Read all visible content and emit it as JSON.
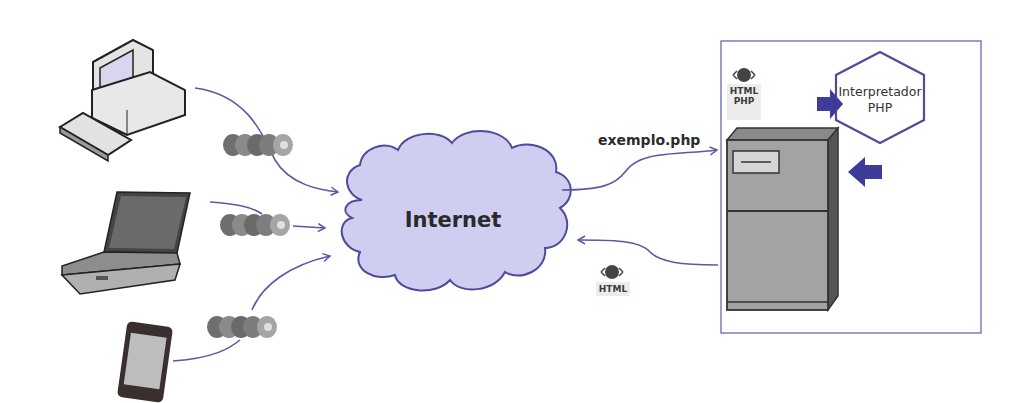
{
  "diagram": {
    "type": "client-server flow",
    "colors": {
      "line": "#5b58a6",
      "cloud_fill": "#cfcdf0",
      "cloud_stroke": "#4e4b9a",
      "arrow_fill": "#3f3b99",
      "frame": "#6a68ad",
      "device_gray": "#9a9a9a"
    },
    "clients": [
      {
        "id": "desktop",
        "icon": "desktop-computer-icon"
      },
      {
        "id": "laptop",
        "icon": "laptop-icon"
      },
      {
        "id": "phone",
        "icon": "smartphone-icon"
      }
    ],
    "browser_icons": [
      {
        "icon": "browser-logos-icon"
      },
      {
        "icon": "browser-logos-icon"
      },
      {
        "icon": "browser-logos-icon"
      }
    ],
    "cloud": {
      "label": "Internet"
    },
    "request": {
      "label": "exemplo.php"
    },
    "server_badge": {
      "line1": "HTML",
      "line2": "PHP"
    },
    "response_badge": {
      "line1": "HTML"
    },
    "interpreter": {
      "line1": "Interpretador",
      "line2": "PHP"
    },
    "server": {
      "icon": "server-tower-icon"
    }
  }
}
